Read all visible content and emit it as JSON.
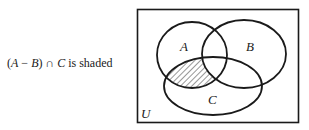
{
  "caption": {
    "prefix": "(",
    "set1": "A",
    "minus": " − ",
    "set2": "B",
    "close": ") ∩ ",
    "set3": "C",
    "suffix": " is shaded"
  },
  "diagram": {
    "universe_label": "U",
    "sets": [
      {
        "label": "A",
        "cx": 192,
        "cy": 55,
        "rx": 35,
        "ry": 33
      },
      {
        "label": "B",
        "cx": 244,
        "cy": 54,
        "rx": 42,
        "ry": 34
      },
      {
        "label": "C",
        "cx": 213,
        "cy": 86,
        "rx": 49,
        "ry": 29
      }
    ],
    "shaded_region": "(A − B) ∩ C",
    "stroke_color": "#1a1a1a",
    "frame": {
      "x": 137,
      "y": 9,
      "width": 161,
      "height": 113
    }
  }
}
